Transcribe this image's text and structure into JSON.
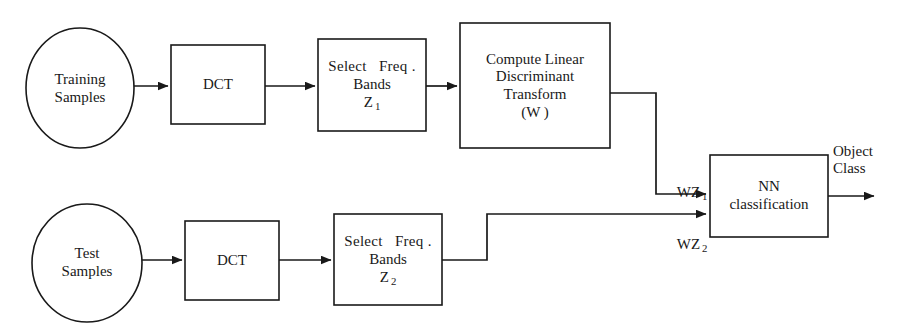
{
  "diagram": {
    "background_color": "#ffffff",
    "stroke_color": "#191919",
    "text_color": "#191919"
  },
  "nodes": {
    "training_samples": {
      "shape": "ellipse",
      "line1": "Training",
      "line2": "Samples"
    },
    "dct_top": {
      "shape": "rectangle",
      "line1": "DCT"
    },
    "select_freq_top": {
      "shape": "rectangle",
      "line1": "Select   Freq .",
      "line2": "Bands",
      "line3_base": "Z",
      "line3_sub": "1"
    },
    "compute_linear": {
      "shape": "rectangle",
      "line1": "Compute Linear",
      "line2": "Discriminant",
      "line3": "Transform",
      "line4": "(W )"
    },
    "test_samples": {
      "shape": "ellipse",
      "line1": "Test",
      "line2": "Samples"
    },
    "dct_bottom": {
      "shape": "rectangle",
      "line1": "DCT"
    },
    "select_freq_bottom": {
      "shape": "rectangle",
      "line1": "Select   Freq .",
      "line2": "Bands",
      "line3_base": "Z",
      "line3_sub": "2"
    },
    "nn_classification": {
      "shape": "rectangle",
      "line1": "NN",
      "line2": "classification"
    }
  },
  "edge_labels": {
    "wz1": {
      "base": "WZ",
      "sub": "1"
    },
    "wz2": {
      "base": "WZ",
      "sub": "2"
    },
    "object_class": {
      "line1": "Object",
      "line2": "Class"
    }
  }
}
